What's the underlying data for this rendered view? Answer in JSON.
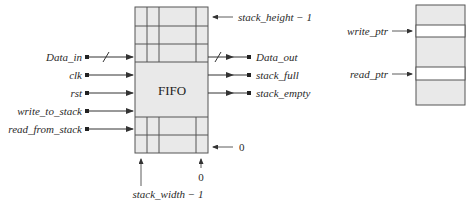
{
  "fifo": {
    "title": "FIFO",
    "fill_color": "#e9e9e9",
    "line_color": "#555555",
    "inputs": [
      {
        "label": "Data_in",
        "bus": true
      },
      {
        "label": "clk",
        "bus": false
      },
      {
        "label": "rst",
        "bus": false
      },
      {
        "label": "write_to_stack",
        "bus": false
      },
      {
        "label": "read_from_stack",
        "bus": false
      }
    ],
    "outputs": [
      {
        "label": "Data_out",
        "bus": true
      },
      {
        "label": "stack_full",
        "bus": false
      },
      {
        "label": "stack_empty",
        "bus": false
      }
    ],
    "annotations": {
      "top_row": "stack_height − 1",
      "bottom_row": "0",
      "left_col": "stack_width − 1",
      "right_col": "0"
    }
  },
  "memory": {
    "fill_color": "#e9e9e9",
    "pointers": [
      {
        "label": "write_ptr"
      },
      {
        "label": "read_ptr"
      }
    ]
  }
}
